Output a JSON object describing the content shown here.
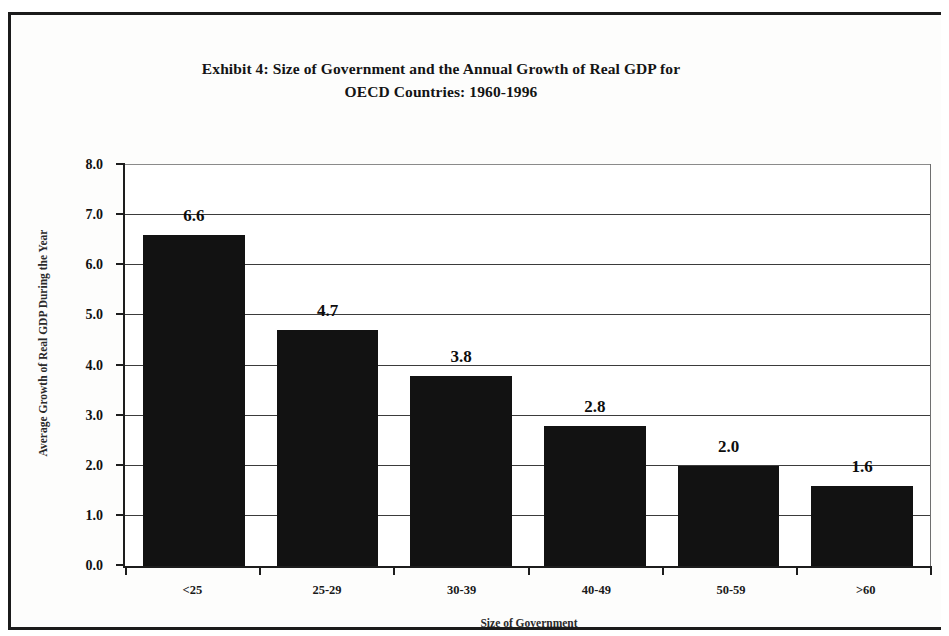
{
  "chart_data": {
    "type": "bar",
    "title": "Exhibit 4: Size of Government and the Annual Growth of Real GDP for OECD Countries:  1960-1996",
    "title_line1": "Exhibit 4: Size of Government and the Annual Growth of Real GDP for",
    "title_line2": "OECD Countries:  1960-1996",
    "categories": [
      "<25",
      "25-29",
      "30-39",
      "40-49",
      "50-59",
      ">60"
    ],
    "values": [
      6.6,
      4.7,
      3.8,
      2.8,
      2.0,
      1.6
    ],
    "value_labels": [
      "6.6",
      "4.7",
      "3.8",
      "2.8",
      "2.0",
      "1.6"
    ],
    "xlabel": "Size of Government",
    "ylabel": "Average Growth of Real GDP During the Year",
    "ylim": [
      0.0,
      8.0
    ],
    "ytick_values": [
      0.0,
      1.0,
      2.0,
      3.0,
      4.0,
      5.0,
      6.0,
      7.0,
      8.0
    ],
    "ytick_labels": [
      "0.0",
      "1.0",
      "2.0",
      "3.0",
      "4.0",
      "5.0",
      "6.0",
      "7.0",
      "8.0"
    ],
    "grid": true,
    "legend": false,
    "bar_color": "#121212",
    "axis_color": "#1d1d1d",
    "background_color": "#ffffff"
  }
}
